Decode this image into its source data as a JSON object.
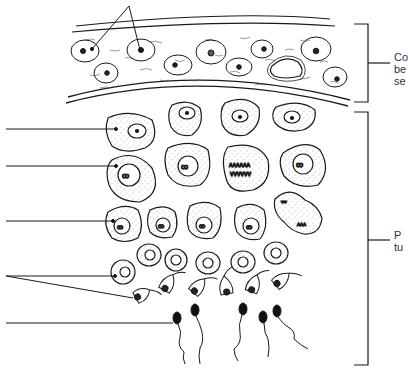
{
  "diagram": {
    "right_labels": [
      {
        "id": "connective-tissue",
        "lines": [
          "Co",
          "be",
          "se"
        ],
        "full_text_visible": "Co be se",
        "bracket": {
          "top": 24,
          "bottom": 102,
          "mid": 63
        }
      },
      {
        "id": "seminiferous-tubule",
        "lines": [
          "P",
          "tu"
        ],
        "full_text_visible": "P tu",
        "bracket": {
          "top": 112,
          "bottom": 365,
          "mid": 240
        }
      }
    ],
    "left_leaders": [
      {
        "id": "leader-1",
        "y": 129,
        "target": "spermatogonium"
      },
      {
        "id": "leader-2",
        "y": 166,
        "target": "primary-spermatocyte"
      },
      {
        "id": "leader-3",
        "y": 221,
        "target": "secondary-spermatocyte"
      },
      {
        "id": "leader-4",
        "y": 276,
        "targets": [
          "spermatid-round",
          "spermatid-elongating"
        ]
      },
      {
        "id": "leader-5",
        "y": 323,
        "target": "spermatozoon"
      }
    ],
    "top_leader": {
      "id": "interstitial-cells-pointer",
      "targets": 2
    },
    "colors": {
      "ink": "#1a1a1a",
      "background": "#ffffff",
      "stipple": "#555555"
    }
  }
}
